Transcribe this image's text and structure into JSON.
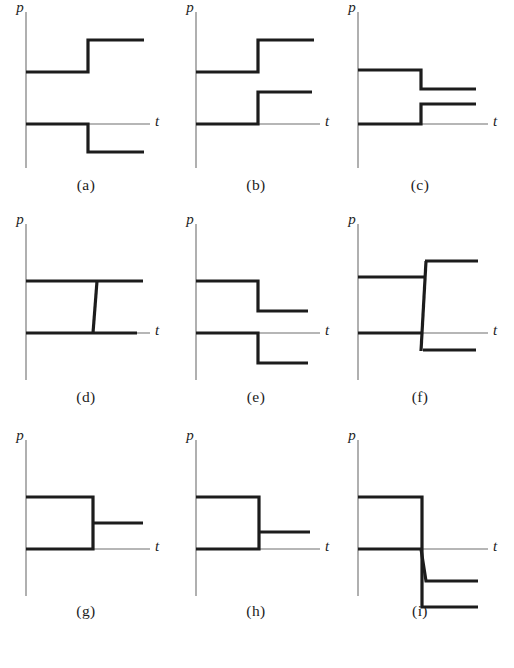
{
  "figure": {
    "title": "",
    "background_color": "#ffffff",
    "ink_color": "#1c1c1c",
    "axis_color": "#6f6f6f",
    "waveform_color": "#1c1c1c",
    "waveform_width": 3.2,
    "axis_width": 1.1,
    "p_label": "p",
    "t_label": "t",
    "grid_columns": 3,
    "grid_rows": 3
  },
  "chart_data": {
    "type": "line",
    "title": "",
    "xlabel": "t",
    "ylabel": "p",
    "grid": false,
    "legend": null,
    "panels": [
      {
        "id": "a",
        "caption": "(a)",
        "origin": {
          "x": 26,
          "y": 124
        },
        "axis": {
          "p_top": 12,
          "p_bottom": 168,
          "t_right": 150
        },
        "p_label_pos": {
          "x": 20,
          "y": 12
        },
        "t_label_pos": {
          "x": 155,
          "y": 126
        },
        "caption_pos": {
          "x": 86,
          "y": 188
        },
        "traces": [
          {
            "name": "upper-trace",
            "points": [
              [
                26,
                72
              ],
              [
                88,
                72
              ],
              [
                88,
                40
              ],
              [
                144,
                40
              ]
            ]
          },
          {
            "name": "lower-trace",
            "points": [
              [
                26,
                124
              ],
              [
                88,
                124
              ],
              [
                88,
                152
              ],
              [
                144,
                152
              ]
            ]
          }
        ]
      },
      {
        "id": "b",
        "caption": "(b)",
        "origin": {
          "x": 196,
          "y": 124
        },
        "axis": {
          "p_top": 12,
          "p_bottom": 168,
          "t_right": 320
        },
        "p_label_pos": {
          "x": 190,
          "y": 12
        },
        "t_label_pos": {
          "x": 325,
          "y": 126
        },
        "caption_pos": {
          "x": 256,
          "y": 188
        },
        "traces": [
          {
            "name": "upper-trace",
            "points": [
              [
                196,
                72
              ],
              [
                258,
                72
              ],
              [
                258,
                40
              ],
              [
                314,
                40
              ]
            ]
          },
          {
            "name": "lower-trace",
            "points": [
              [
                196,
                124
              ],
              [
                258,
                124
              ],
              [
                258,
                92
              ],
              [
                312,
                92
              ]
            ]
          }
        ]
      },
      {
        "id": "c",
        "caption": "(c)",
        "origin": {
          "x": 358,
          "y": 124
        },
        "axis": {
          "p_top": 12,
          "p_bottom": 168,
          "t_right": 488
        },
        "p_label_pos": {
          "x": 352,
          "y": 12
        },
        "t_label_pos": {
          "x": 493,
          "y": 126
        },
        "caption_pos": {
          "x": 420,
          "y": 188
        },
        "traces": [
          {
            "name": "upper-trace",
            "points": [
              [
                358,
                70
              ],
              [
                421,
                70
              ],
              [
                421,
                89
              ],
              [
                476,
                89
              ]
            ]
          },
          {
            "name": "lower-trace",
            "points": [
              [
                358,
                124
              ],
              [
                421,
                124
              ],
              [
                421,
                104
              ],
              [
                476,
                104
              ]
            ]
          }
        ]
      },
      {
        "id": "d",
        "caption": "(d)",
        "origin": {
          "x": 26,
          "y": 333
        },
        "axis": {
          "p_top": 224,
          "p_bottom": 380,
          "t_right": 150
        },
        "p_label_pos": {
          "x": 20,
          "y": 224
        },
        "t_label_pos": {
          "x": 155,
          "y": 335
        },
        "caption_pos": {
          "x": 86,
          "y": 400
        },
        "traces": [
          {
            "name": "upper-trace",
            "points": [
              [
                26,
                281
              ],
              [
                143,
                281
              ]
            ]
          },
          {
            "name": "lower-trace",
            "points": [
              [
                26,
                333
              ],
              [
                137,
                333
              ]
            ]
          },
          {
            "name": "transition-edge",
            "points": [
              [
                97,
                281
              ],
              [
                93,
                333
              ]
            ]
          }
        ]
      },
      {
        "id": "e",
        "caption": "(e)",
        "origin": {
          "x": 196,
          "y": 333
        },
        "axis": {
          "p_top": 224,
          "p_bottom": 380,
          "t_right": 320
        },
        "p_label_pos": {
          "x": 190,
          "y": 224
        },
        "t_label_pos": {
          "x": 325,
          "y": 335
        },
        "caption_pos": {
          "x": 256,
          "y": 400
        },
        "traces": [
          {
            "name": "upper-trace",
            "points": [
              [
                196,
                281
              ],
              [
                258,
                281
              ],
              [
                258,
                311
              ],
              [
                308,
                311
              ]
            ]
          },
          {
            "name": "lower-trace",
            "points": [
              [
                196,
                333
              ],
              [
                258,
                333
              ],
              [
                258,
                363
              ],
              [
                308,
                363
              ]
            ]
          }
        ]
      },
      {
        "id": "f",
        "caption": "(f)",
        "origin": {
          "x": 358,
          "y": 333
        },
        "axis": {
          "p_top": 224,
          "p_bottom": 380,
          "t_right": 488
        },
        "p_label_pos": {
          "x": 352,
          "y": 224
        },
        "t_label_pos": {
          "x": 493,
          "y": 335
        },
        "caption_pos": {
          "x": 420,
          "y": 400
        },
        "traces": [
          {
            "name": "upper-left-trace",
            "points": [
              [
                358,
                277
              ],
              [
                425,
                277
              ]
            ]
          },
          {
            "name": "upper-right-trace",
            "points": [
              [
                425,
                261
              ],
              [
                478,
                261
              ]
            ]
          },
          {
            "name": "lower-left-trace",
            "points": [
              [
                358,
                333
              ],
              [
                423,
                333
              ]
            ]
          },
          {
            "name": "lower-right-trace",
            "points": [
              [
                423,
                350
              ],
              [
                476,
                350
              ]
            ]
          },
          {
            "name": "transition-edge",
            "points": [
              [
                426,
                261
              ],
              [
                421,
                351
              ]
            ]
          }
        ]
      },
      {
        "id": "g",
        "caption": "(g)",
        "origin": {
          "x": 26,
          "y": 549
        },
        "axis": {
          "p_top": 440,
          "p_bottom": 596,
          "t_right": 150
        },
        "p_label_pos": {
          "x": 20,
          "y": 440
        },
        "t_label_pos": {
          "x": 155,
          "y": 551
        },
        "caption_pos": {
          "x": 86,
          "y": 614
        },
        "traces": [
          {
            "name": "pulse-trace",
            "points": [
              [
                26,
                497
              ],
              [
                93,
                497
              ],
              [
                93,
                549
              ],
              [
                26,
                549
              ]
            ]
          },
          {
            "name": "branch-trace",
            "points": [
              [
                93,
                523
              ],
              [
                143,
                523
              ]
            ]
          }
        ]
      },
      {
        "id": "h",
        "caption": "(h)",
        "origin": {
          "x": 196,
          "y": 549
        },
        "axis": {
          "p_top": 440,
          "p_bottom": 596,
          "t_right": 320
        },
        "p_label_pos": {
          "x": 190,
          "y": 440
        },
        "t_label_pos": {
          "x": 325,
          "y": 551
        },
        "caption_pos": {
          "x": 256,
          "y": 614
        },
        "traces": [
          {
            "name": "pulse-trace",
            "points": [
              [
                196,
                497
              ],
              [
                259,
                497
              ],
              [
                259,
                549
              ],
              [
                196,
                549
              ]
            ]
          },
          {
            "name": "branch-trace",
            "points": [
              [
                259,
                532
              ],
              [
                310,
                532
              ]
            ]
          }
        ]
      },
      {
        "id": "i",
        "caption": "(i)",
        "origin": {
          "x": 358,
          "y": 549
        },
        "axis": {
          "p_top": 440,
          "p_bottom": 596,
          "t_right": 488
        },
        "p_label_pos": {
          "x": 352,
          "y": 440
        },
        "t_label_pos": {
          "x": 493,
          "y": 551
        },
        "caption_pos": {
          "x": 420,
          "y": 614
        },
        "traces": [
          {
            "name": "upper-trace",
            "points": [
              [
                358,
                497
              ],
              [
                422,
                497
              ],
              [
                422,
                607
              ],
              [
                478,
                607
              ]
            ]
          },
          {
            "name": "lower-trace",
            "points": [
              [
                358,
                549
              ],
              [
                421,
                549
              ],
              [
                426,
                581
              ],
              [
                478,
                581
              ]
            ]
          }
        ]
      }
    ]
  }
}
